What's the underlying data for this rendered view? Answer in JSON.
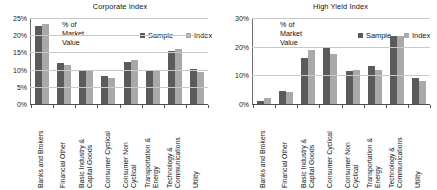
{
  "figure": {
    "axis_label": "% of\nMarket\nValue",
    "legend": [
      {
        "name": "Sample",
        "color": "#5b5b5b"
      },
      {
        "name": "Index",
        "color": "#a9a9a9"
      }
    ]
  },
  "chart_data": [
    {
      "type": "bar",
      "title": "Corporate Index",
      "xlabel": "",
      "ylabel": "% of Market Value",
      "ylim": [
        0,
        25
      ],
      "ytick_labels": [
        "0%",
        "5%",
        "10%",
        "15%",
        "20%",
        "25%"
      ],
      "ytick_values": [
        0,
        5,
        10,
        15,
        20,
        25
      ],
      "grid": true,
      "legend_position": "top-right",
      "categories": [
        "Banks and Brokers",
        "Financial Other",
        "Basic Industry &\nCapital Goods",
        "Consumer Cyclical",
        "Consumer Non\nCyclical",
        "Transportation &\nEnergy",
        "Technology &\nCommunications",
        "Utility"
      ],
      "series": [
        {
          "name": "Sample",
          "color": "#5b5b5b",
          "values": [
            22.8,
            12.0,
            9.9,
            8.1,
            12.2,
            9.5,
            15.5,
            10.1
          ]
        },
        {
          "name": "Index",
          "color": "#a9a9a9",
          "values": [
            23.4,
            11.3,
            9.9,
            7.6,
            12.8,
            9.9,
            16.0,
            9.4
          ]
        }
      ]
    },
    {
      "type": "bar",
      "title": "High Yield Index",
      "xlabel": "",
      "ylabel": "% of Market Value",
      "ylim": [
        0,
        30
      ],
      "ytick_labels": [
        "0%",
        "10%",
        "20%",
        "30%"
      ],
      "ytick_values": [
        0,
        10,
        20,
        30
      ],
      "grid": true,
      "legend_position": "top-right",
      "categories": [
        "Banks and Brokers",
        "Financial Other",
        "Basic Industry &\nCapital Goods",
        "Consumer Cyclical",
        "Consumer Non\nCyclical",
        "Transportation &\nEnergy",
        "Technology &\nCommunications",
        "Utility"
      ],
      "series": [
        {
          "name": "Sample",
          "color": "#5b5b5b",
          "values": [
            1.2,
            4.6,
            16.0,
            19.4,
            11.5,
            13.3,
            23.6,
            9.0
          ]
        },
        {
          "name": "Index",
          "color": "#a9a9a9",
          "values": [
            2.0,
            4.3,
            18.7,
            17.6,
            12.0,
            11.7,
            23.6,
            8.2
          ]
        }
      ]
    }
  ]
}
